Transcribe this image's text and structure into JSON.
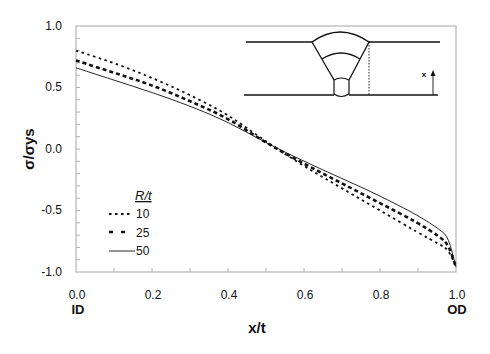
{
  "chart_data": {
    "type": "line",
    "title": "",
    "xlabel": "x/t",
    "ylabel": "σ/σys",
    "xlim": [
      0.0,
      1.0
    ],
    "ylim": [
      -1.0,
      1.0
    ],
    "x_ticks": [
      "0.0",
      "0.2",
      "0.4",
      "0.6",
      "0.8",
      "1.0"
    ],
    "y_ticks": [
      "1.0",
      "0.5",
      "0.0",
      "-0.5",
      "-1.0"
    ],
    "x_tick_sublabels": {
      "0.0": "ID",
      "1.0": "OD"
    },
    "grid": false,
    "legend": {
      "title": "R/t",
      "position": "lower-left",
      "entries": [
        "10",
        "25",
        "50"
      ]
    },
    "x": [
      0.0,
      0.1,
      0.2,
      0.3,
      0.4,
      0.5,
      0.6,
      0.7,
      0.8,
      0.9,
      0.96,
      0.98,
      1.0
    ],
    "series": [
      {
        "name": "10",
        "style": "dotted",
        "values": [
          0.8,
          0.7,
          0.58,
          0.44,
          0.28,
          0.06,
          -0.14,
          -0.32,
          -0.5,
          -0.68,
          -0.78,
          -0.82,
          -0.96
        ]
      },
      {
        "name": "25",
        "style": "dashed",
        "values": [
          0.72,
          0.62,
          0.52,
          0.39,
          0.25,
          0.05,
          -0.12,
          -0.28,
          -0.44,
          -0.6,
          -0.72,
          -0.78,
          -0.96
        ]
      },
      {
        "name": "50",
        "style": "solid",
        "values": [
          0.66,
          0.56,
          0.46,
          0.35,
          0.22,
          0.05,
          -0.1,
          -0.24,
          -0.38,
          -0.54,
          -0.66,
          -0.72,
          -0.96
        ]
      }
    ],
    "inset": {
      "description": "Weld cross-section schematic with through-thickness coordinate",
      "x_arrow_label": "x"
    }
  },
  "labels": {
    "xlabel": "x/t",
    "ylabel": "σ/σys",
    "id": "ID",
    "od": "OD",
    "legend_title": "R/t",
    "legend_10": "10",
    "legend_25": "25",
    "legend_50": "50",
    "inset_x": "x",
    "xt0": "0.0",
    "xt1": "0.2",
    "xt2": "0.4",
    "xt3": "0.6",
    "xt4": "0.8",
    "xt5": "1.0",
    "yt0": "1.0",
    "yt1": "0.5",
    "yt2": "0.0",
    "yt3": "-0.5",
    "yt4": "-1.0"
  },
  "colors": {
    "axis": "#b0b0b0",
    "line": "#111111"
  }
}
